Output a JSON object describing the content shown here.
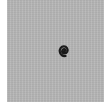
{
  "tile": {
    "background_color": "#b5b5b5",
    "symbol": {
      "icon": "spiral-icon",
      "color": "#1a1a1a"
    }
  }
}
